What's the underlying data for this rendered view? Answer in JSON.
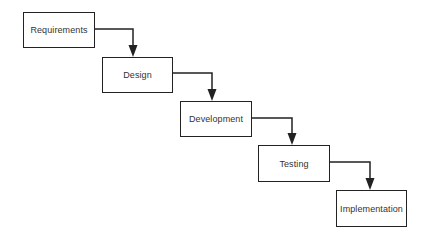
{
  "diagram": {
    "type": "waterfall",
    "stages": [
      {
        "id": "requirements",
        "label": "Requirements",
        "x": 23,
        "y": 12,
        "w": 72,
        "h": 36
      },
      {
        "id": "design",
        "label": "Design",
        "x": 102,
        "y": 57,
        "w": 71,
        "h": 36
      },
      {
        "id": "development",
        "label": "Development",
        "x": 180,
        "y": 101,
        "w": 72,
        "h": 36
      },
      {
        "id": "testing",
        "label": "Testing",
        "x": 258,
        "y": 145,
        "w": 72,
        "h": 37
      },
      {
        "id": "implementation",
        "label": "Implementation",
        "x": 336,
        "y": 190,
        "w": 71,
        "h": 37
      }
    ],
    "arrows": [
      {
        "from": "requirements",
        "to": "design",
        "path": "M95,29 L133,29 L133,45"
      },
      {
        "from": "design",
        "to": "development",
        "path": "M173,73 L212,73 L212,89"
      },
      {
        "from": "development",
        "to": "testing",
        "path": "M252,118 L292,118 L292,133"
      },
      {
        "from": "testing",
        "to": "implementation",
        "path": "M330,162 L370,162 L370,178"
      }
    ],
    "colors": {
      "stroke": "#222222",
      "text": "#333333",
      "background": "#ffffff"
    }
  }
}
